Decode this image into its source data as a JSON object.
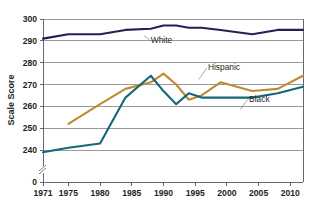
{
  "chart_data": {
    "type": "line",
    "title": "",
    "xlabel": "",
    "ylabel": "Scale Score",
    "xlim": [
      1971,
      2012
    ],
    "ylim": [
      235,
      300
    ],
    "grid": true,
    "legend_position": "inline-labels",
    "y_ticks": [
      "300",
      "290",
      "280",
      "270",
      "260",
      "250",
      "240",
      "0"
    ],
    "y_tick_values": [
      300,
      290,
      280,
      270,
      260,
      250,
      240
    ],
    "x_ticks": [
      "1971",
      "1975",
      "1980",
      "1985",
      "1990",
      "1995",
      "2000",
      "2005",
      "2010"
    ],
    "x_tick_values": [
      1971,
      1975,
      1980,
      1985,
      1990,
      1995,
      2000,
      2005,
      2010
    ],
    "axis_break": true,
    "series": [
      {
        "name": "White",
        "color": "#1f2257",
        "label_x": 1988,
        "label_y": 289.2,
        "x": [
          1971,
          1975,
          1980,
          1984,
          1988,
          1990,
          1992,
          1994,
          1996,
          1999,
          2004,
          2008,
          2012
        ],
        "values": [
          291,
          293,
          293,
          295,
          295.5,
          297,
          297,
          296,
          296,
          295,
          293,
          295,
          295
        ]
      },
      {
        "name": "Hispanic",
        "color": "#c08b2e",
        "label_x": 1997,
        "label_y": 276.5,
        "x": [
          1975,
          1980,
          1984,
          1988,
          1990,
          1992,
          1994,
          1996,
          1999,
          2004,
          2008,
          2012
        ],
        "values": [
          252,
          261,
          268,
          271,
          275,
          270,
          263,
          265,
          271,
          267,
          268,
          274
        ]
      },
      {
        "name": "Black",
        "color": "#16667a",
        "label_x": 2003.5,
        "label_y": 262.2,
        "x": [
          1971,
          1975,
          1980,
          1984,
          1988,
          1990,
          1992,
          1994,
          1996,
          1999,
          2004,
          2008,
          2012
        ],
        "values": [
          239,
          241,
          243,
          264,
          274,
          267,
          261,
          266,
          264,
          264,
          264,
          266,
          269
        ]
      }
    ]
  },
  "labels": {
    "y_axis_title": "Scale Score",
    "zero_tick": "0",
    "white": "White",
    "hispanic": "Hispanic",
    "black": "Black"
  }
}
